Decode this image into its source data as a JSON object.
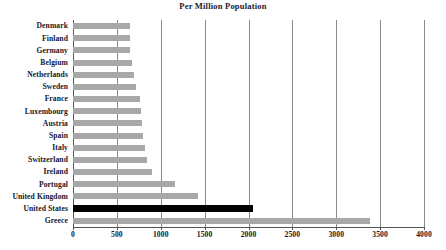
{
  "chart_data": {
    "type": "bar",
    "orientation": "horizontal",
    "title": "Per Million Population",
    "xlabel": "",
    "ylabel": "",
    "xlim": [
      0,
      4000
    ],
    "xticks": [
      0,
      500,
      1000,
      1500,
      2000,
      2500,
      3000,
      3500,
      4000
    ],
    "grid": true,
    "grid_axis": "x",
    "legend": "none",
    "bar_color": "#a8a8a8",
    "highlight_color": "#000000",
    "highlight_category": "United States",
    "categories": [
      "Denmark",
      "Finland",
      "Germany",
      "Belgium",
      "Netherlands",
      "Sweden",
      "France",
      "Luxembourg",
      "Austria",
      "Spain",
      "Italy",
      "Switzerland",
      "Ireland",
      "Portugal",
      "United Kingdom",
      "United States",
      "Greece"
    ],
    "values": [
      650,
      650,
      650,
      675,
      690,
      720,
      760,
      775,
      790,
      800,
      820,
      840,
      900,
      1160,
      1420,
      2050,
      3385
    ]
  }
}
